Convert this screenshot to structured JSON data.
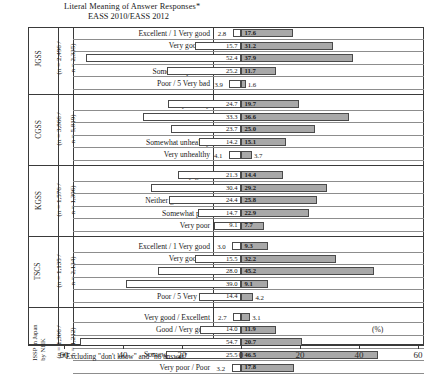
{
  "title": {
    "line1": "Literal Meaning of Answer Responses*",
    "line2": "EASS 2010/EASS 2012"
  },
  "footnote": "*Excluding \"don't know\" and \"no answer\"",
  "unit_label": "(%)",
  "axis": {
    "ticks": [
      "60",
      "40",
      "20",
      "0",
      "20",
      "40",
      "60"
    ],
    "range_each_side": 60,
    "gridlines": false
  },
  "series": [
    {
      "name": "EASS 2010",
      "color": "#ffffff",
      "side": "left"
    },
    {
      "name": "EASS 2012",
      "color": "#a8a8a8",
      "side": "right"
    }
  ],
  "groups": [
    {
      "name": "JGSS",
      "n_left": "(n = 2,496 /",
      "n_right": "n = 2,335)",
      "rows": [
        {
          "label": "Excellent / 1 Very good",
          "left": 2.8,
          "right": 17.6
        },
        {
          "label": "Very good / 2",
          "left": 15.7,
          "right": 31.2
        },
        {
          "label": "Good / 3",
          "left": 52.4,
          "right": 37.9
        },
        {
          "label": "Somewhat poor / 4",
          "left": 25.2,
          "right": 11.7
        },
        {
          "label": "Poor / 5 Very bad",
          "left": 3.9,
          "right": 1.6
        }
      ]
    },
    {
      "name": "CGSS",
      "n_left": "(n = 3,866 /",
      "n_right": "n = 5,819)",
      "rows": [
        {
          "label": "Very healthy",
          "left": 24.7,
          "right": 19.7
        },
        {
          "label": "Somewhat healthy",
          "left": 33.3,
          "right": 36.6
        },
        {
          "label": "General",
          "left": 23.7,
          "right": 25.0
        },
        {
          "label": "Somewhat unhealthy",
          "left": 14.2,
          "right": 15.1
        },
        {
          "label": "Very unhealthy",
          "left": 4.1,
          "right": 3.7
        }
      ]
    },
    {
      "name": "KGSS",
      "n_left": "(n = 1,576 /",
      "n_right": "n = 1,396)",
      "rows": [
        {
          "label": "Very good",
          "left": 21.3,
          "right": 14.4
        },
        {
          "label": "Somewhat good",
          "left": 30.4,
          "right": 29.2
        },
        {
          "label": "Neither good nor bad",
          "left": 24.4,
          "right": 25.8
        },
        {
          "label": "Somewhat poor",
          "left": 14.7,
          "right": 22.9
        },
        {
          "label": "Very poor",
          "left": 9.1,
          "right": 7.7
        }
      ]
    },
    {
      "name": "TSCS",
      "n_left": "(n = 1,135 /",
      "n_right": "n = 2,134)",
      "rows": [
        {
          "label": "Excellent / 1 Very good",
          "left": 3.0,
          "right": 9.3
        },
        {
          "label": "Very good / 2",
          "left": 15.5,
          "right": 32.2
        },
        {
          "label": "Good / 3",
          "left": 28.0,
          "right": 45.2
        },
        {
          "label": "Fair / 4",
          "left": 39.0,
          "right": 9.1
        },
        {
          "label": "Poor / 5 Very bad",
          "left": 14.4,
          "right": 4.2
        }
      ]
    },
    {
      "name": "ISSP in Japan by NHK",
      "n_left": "(n = 1,306 /",
      "n_right": "n = 1,212)",
      "rows": [
        {
          "label": "Very good / Excellent",
          "left": 2.7,
          "right": 3.1
        },
        {
          "label": "Good / Very good",
          "left": 14.0,
          "right": 11.9
        },
        {
          "label": "Fair / Good",
          "left": 54.7,
          "right": 20.7
        },
        {
          "label": "Somewhat poor / Fair",
          "left": 25.5,
          "right": 46.5
        },
        {
          "label": "Very poor / Poor",
          "left": 3.2,
          "right": 17.8
        }
      ]
    }
  ],
  "chart_data": {
    "type": "bar",
    "title": "Literal Meaning of Answer Responses*",
    "subtitle": "EASS 2010/EASS 2012",
    "orientation": "horizontal-diverging",
    "xlabel": "(%)",
    "ylabel": "",
    "xlim": [
      -60,
      60
    ],
    "xticks": [
      -60,
      -40,
      -20,
      0,
      20,
      40,
      60
    ],
    "xticklabels": [
      "60",
      "40",
      "20",
      "0",
      "20",
      "40",
      "60"
    ],
    "grid": false,
    "legend_position": "none",
    "series": [
      {
        "name": "EASS 2010",
        "side": "left",
        "color": "#ffffff"
      },
      {
        "name": "EASS 2012",
        "side": "right",
        "color": "#a8a8a8"
      }
    ],
    "panels": [
      {
        "group": "JGSS",
        "n": "n = 2,496 / n = 2,335",
        "categories": [
          "Excellent / 1 Very good",
          "Very good / 2",
          "Good / 3",
          "Somewhat poor / 4",
          "Poor / 5 Very bad"
        ],
        "EASS 2010": [
          2.8,
          15.7,
          52.4,
          25.2,
          3.9
        ],
        "EASS 2012": [
          17.6,
          31.2,
          37.9,
          11.7,
          1.6
        ]
      },
      {
        "group": "CGSS",
        "n": "n = 3,866 / n = 5,819",
        "categories": [
          "Very healthy",
          "Somewhat healthy",
          "General",
          "Somewhat unhealthy",
          "Very unhealthy"
        ],
        "EASS 2010": [
          24.7,
          33.3,
          23.7,
          14.2,
          4.1
        ],
        "EASS 2012": [
          19.7,
          36.6,
          25.0,
          15.1,
          3.7
        ]
      },
      {
        "group": "KGSS",
        "n": "n = 1,576 / n = 1,396",
        "categories": [
          "Very good",
          "Somewhat good",
          "Neither good nor bad",
          "Somewhat poor",
          "Very poor"
        ],
        "EASS 2010": [
          21.3,
          30.4,
          24.4,
          14.7,
          9.1
        ],
        "EASS 2012": [
          14.4,
          29.2,
          25.8,
          22.9,
          7.7
        ]
      },
      {
        "group": "TSCS",
        "n": "n = 1,135 / n = 2,134",
        "categories": [
          "Excellent / 1 Very good",
          "Very good / 2",
          "Good / 3",
          "Fair / 4",
          "Poor / 5 Very bad"
        ],
        "EASS 2010": [
          3.0,
          15.5,
          28.0,
          39.0,
          14.4
        ],
        "EASS 2012": [
          9.3,
          32.2,
          45.2,
          9.1,
          4.2
        ]
      },
      {
        "group": "ISSP in Japan by NHK",
        "n": "n = 1,306 / n = 1,212",
        "categories": [
          "Very good / Excellent",
          "Good / Very good",
          "Fair / Good",
          "Somewhat poor / Fair",
          "Very poor / Poor"
        ],
        "EASS 2010": [
          2.7,
          14.0,
          54.7,
          25.5,
          3.2
        ],
        "EASS 2012": [
          3.1,
          11.9,
          20.7,
          46.5,
          17.8
        ]
      }
    ],
    "footnote": "*Excluding \"don't know\" and \"no answer\""
  }
}
